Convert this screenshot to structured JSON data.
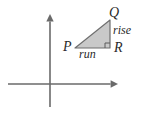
{
  "figure": {
    "background_color": "#ffffff",
    "width": 143,
    "height": 115,
    "axes": {
      "color": "#6a6a6a",
      "stroke_width": 1.6,
      "origin": {
        "x": 50,
        "y": 84
      },
      "x_axis": {
        "x_start": 8,
        "x_end": 118,
        "y": 84,
        "arrow": "right"
      },
      "y_axis": {
        "x": 50,
        "y_start": 107,
        "y_end": 14,
        "arrow": "up"
      }
    },
    "triangle": {
      "fill_color": "#c9c9c9",
      "stroke_color": "#6f6f6f",
      "stroke_width": 1.2,
      "vertices": [
        {
          "name": "P",
          "x": 75,
          "y": 48
        },
        {
          "name": "Q",
          "x": 110,
          "y": 20
        },
        {
          "name": "R",
          "x": 110,
          "y": 48
        }
      ],
      "right_angle_at": "R",
      "right_angle_marker_size": 5
    },
    "labels": {
      "vertex_p": "P",
      "vertex_q": "Q",
      "vertex_r": "R",
      "leg_vertical": "rise",
      "leg_horizontal": "run"
    }
  },
  "chart_data": {
    "type": "scatter",
    "title": "",
    "xlabel": "",
    "ylabel": "",
    "grid": false,
    "legend": "none",
    "annotations": [
      "P",
      "Q",
      "R",
      "rise",
      "run"
    ],
    "points": [
      {
        "label": "P",
        "x": 75,
        "y": 48
      },
      {
        "label": "Q",
        "x": 110,
        "y": 20
      },
      {
        "label": "R",
        "x": 110,
        "y": 48
      }
    ]
  }
}
